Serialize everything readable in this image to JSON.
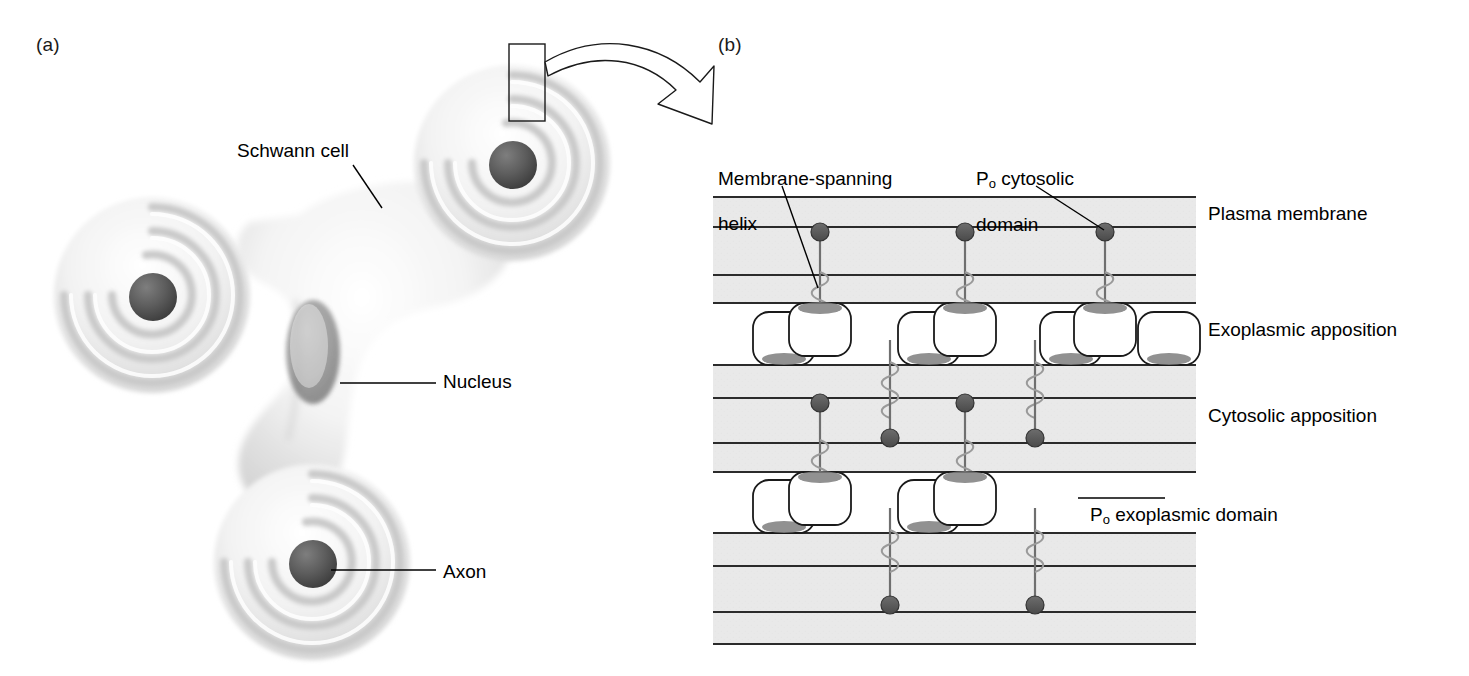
{
  "figure": {
    "panels": [
      {
        "id": "a",
        "letter": "(a)",
        "caption": "Schwann cell wrapping axons"
      },
      {
        "id": "b",
        "letter": "(b)",
        "caption": "Molecular organization of compacted myelin membranes"
      }
    ]
  },
  "panel_a": {
    "letter": "(a)",
    "labels": [
      {
        "name": "schwann-cell",
        "text": "Schwann cell"
      },
      {
        "name": "nucleus",
        "text": "Nucleus"
      },
      {
        "name": "axon",
        "text": "Axon"
      }
    ],
    "structures": {
      "spiral_count": 3,
      "spiral_description": "three myelin spiral wraps around axons",
      "nucleus_description": "elongated dark oval nucleus in cell body",
      "axon_description": "dark circular axon core at spiral center"
    },
    "zoom_box": {
      "label": "region-of-interest-box"
    },
    "callout_arrow": {
      "label": "magnification-arrow",
      "direction": "left-to-right curving down"
    }
  },
  "panel_b": {
    "letter": "(b)",
    "labels": [
      {
        "name": "membrane-spanning-helix",
        "text": "Membrane-spanning\nhelix"
      },
      {
        "name": "po-cytosolic-domain",
        "text": "P₀ cytosolic\ndomain"
      },
      {
        "name": "plasma-membrane",
        "text": "Plasma membrane"
      },
      {
        "name": "exoplasmic-apposition",
        "text": "Exoplasmic apposition"
      },
      {
        "name": "cytosolic-apposition",
        "text": "Cytosolic apposition"
      },
      {
        "name": "po-exoplasmic-domain",
        "text": "P₀ exoplasmic domain"
      }
    ],
    "label_texts": {
      "membrane_spanning_helix_line1": "Membrane-spanning",
      "membrane_spanning_helix_line2": "helix",
      "po_cytosolic_line1_prefix": "P",
      "po_cytosolic_line1_sub": "o",
      "po_cytosolic_line1_rest": " cytosolic",
      "po_cytosolic_line2": "domain",
      "plasma_membrane": "Plasma membrane",
      "exoplasmic_apposition": "Exoplasmic apposition",
      "cytosolic_apposition": "Cytosolic apposition",
      "po_exo_prefix": "P",
      "po_exo_sub": "o",
      "po_exo_rest": " exoplasmic domain"
    },
    "geometry": {
      "left": 713,
      "right": 1196,
      "top": 196,
      "bottom": 645,
      "membrane_bands": [
        {
          "y_top": 196,
          "y_bottom": 227,
          "kind": "membrane-leaflet"
        },
        {
          "y_top": 227,
          "y_bottom": 275,
          "kind": "membrane-interior"
        },
        {
          "y_top": 275,
          "y_bottom": 303,
          "kind": "membrane-leaflet"
        },
        {
          "y_top": 303,
          "y_bottom": 365,
          "kind": "exoplasmic-gap"
        },
        {
          "y_top": 365,
          "y_bottom": 398,
          "kind": "membrane-leaflet"
        },
        {
          "y_top": 398,
          "y_bottom": 443,
          "kind": "membrane-interior"
        },
        {
          "y_top": 443,
          "y_bottom": 472,
          "kind": "membrane-leaflet"
        },
        {
          "y_top": 472,
          "y_bottom": 533,
          "kind": "exoplasmic-gap"
        },
        {
          "y_top": 533,
          "y_bottom": 566,
          "kind": "membrane-leaflet"
        },
        {
          "y_top": 566,
          "y_bottom": 612,
          "kind": "membrane-interior"
        },
        {
          "y_top": 612,
          "y_bottom": 645,
          "kind": "membrane-leaflet"
        }
      ],
      "protein_columns_upper": [
        820,
        965,
        1105
      ],
      "protein_columns_lower": [
        890,
        1035
      ],
      "po_box_width": 66,
      "po_box_height": 56
    },
    "colors": {
      "membrane_fill": "#e9e9e9",
      "membrane_line": "#2b2b2b",
      "protein_dot": "#555555",
      "helix_stroke": "#8a8a8a",
      "po_patch": "#7a7a7a",
      "po_box_fill": "#ffffff",
      "label_text": "#000000",
      "background": "#ffffff"
    }
  }
}
